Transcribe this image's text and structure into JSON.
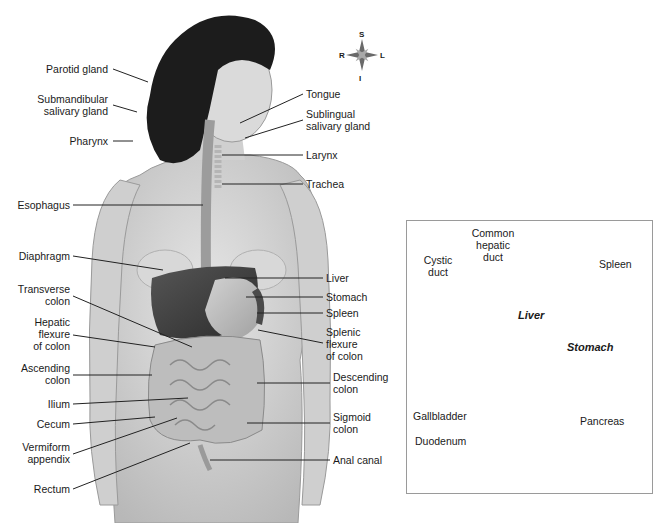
{
  "figure": {
    "compass": {
      "superior": "S",
      "inferior": "I",
      "right": "R",
      "left": "L"
    },
    "colors": {
      "skin": "#d9d9d9",
      "hair": "#1c1c1c",
      "organ_dark": "#3a3a3a",
      "organ_mid": "#8e8e8e",
      "organ_light": "#c4c4c4",
      "leader_line": "#222222",
      "inset_border": "#9a9a9a"
    }
  },
  "labels_left": [
    {
      "text": "Parotid gland"
    },
    {
      "text": "Submandibular\nsalivary gland"
    },
    {
      "text": "Pharynx"
    },
    {
      "text": "Esophagus"
    },
    {
      "text": "Diaphragm"
    },
    {
      "text": "Transverse\ncolon"
    },
    {
      "text": "Hepatic\nflexure\nof colon"
    },
    {
      "text": "Ascending\ncolon"
    },
    {
      "text": "Ilium"
    },
    {
      "text": "Cecum"
    },
    {
      "text": "Vermiform\nappendix"
    },
    {
      "text": "Rectum"
    }
  ],
  "labels_right": [
    {
      "text": "Tongue"
    },
    {
      "text": "Sublingual\nsalivary gland"
    },
    {
      "text": "Larynx"
    },
    {
      "text": "Trachea"
    },
    {
      "text": "Liver"
    },
    {
      "text": "Stomach"
    },
    {
      "text": "Spleen"
    },
    {
      "text": "Splenic\nflexure\nof colon"
    },
    {
      "text": "Descending\ncolon"
    },
    {
      "text": "Sigmoid\ncolon"
    },
    {
      "text": "Anal canal"
    }
  ],
  "inset": {
    "labels": [
      {
        "text": "Common\nhepatic\nduct"
      },
      {
        "text": "Cystic\nduct"
      },
      {
        "text": "Spleen"
      },
      {
        "text": "Gallbladder"
      },
      {
        "text": "Pancreas"
      },
      {
        "text": "Duodenum"
      }
    ],
    "organ_labels": {
      "liver": "Liver",
      "stomach": "Stomach"
    }
  }
}
